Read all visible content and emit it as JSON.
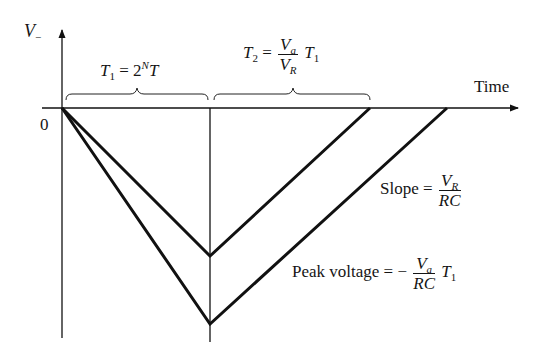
{
  "diagram": {
    "y_axis_label": "V",
    "y_axis_label_subscript": "−",
    "x_axis_label": "Time",
    "origin_label": "0",
    "t1": {
      "symbol": "T",
      "subscript": "1",
      "equals": "=",
      "base": "2",
      "exponent": "N",
      "tail": "T"
    },
    "t2": {
      "symbol": "T",
      "subscript": "2",
      "equals": "=",
      "num": "V",
      "num_sub": "a",
      "den": "V",
      "den_sub": "R",
      "tail": "T",
      "tail_sub": "1"
    },
    "slope": {
      "label": "Slope =",
      "num": "V",
      "num_sub": "R",
      "den": "RC"
    },
    "peak": {
      "label": "Peak voltage = −",
      "num": "V",
      "num_sub": "a",
      "den": "RC",
      "tail": "T",
      "tail_sub": "1"
    },
    "colors": {
      "line": "#111111",
      "background": "#ffffff"
    }
  }
}
